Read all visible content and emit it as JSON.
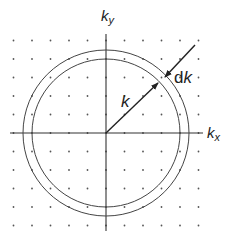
{
  "diagram": {
    "type": "k-space shell diagram",
    "origin": {
      "x": 106,
      "y": 133
    },
    "lattice": {
      "spacing": 18.5,
      "columns": 11,
      "rows": 11,
      "dot_color": "#555555"
    },
    "axes": {
      "x_label": {
        "base": "k",
        "sub": "x"
      },
      "y_label": {
        "base": "k",
        "sub": "y"
      },
      "color": "#333333"
    },
    "circles": {
      "inner_radius": 74,
      "outer_radius": 83,
      "color": "#444444"
    },
    "arrows": {
      "k": {
        "label": "k"
      },
      "dk": {
        "label_prefix": "d",
        "label_var": "k"
      }
    }
  }
}
